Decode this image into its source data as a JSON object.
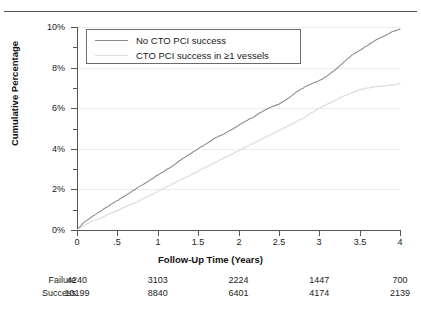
{
  "chart_data": {
    "type": "line",
    "title": "",
    "xlabel": "Follow-Up Time (Years)",
    "ylabel": "Cumulative Percentage",
    "xlim": [
      0,
      4
    ],
    "ylim": [
      0,
      10
    ],
    "grid": true,
    "legend_position": "top-left",
    "xticks": [
      "0",
      ".5",
      "1",
      "1.5",
      "2",
      "2.5",
      "3",
      "3.5",
      "4"
    ],
    "xtick_values": [
      0,
      0.5,
      1,
      1.5,
      2,
      2.5,
      3,
      3.5,
      4
    ],
    "yticks": [
      "0%",
      "2%",
      "4%",
      "6%",
      "8%",
      "10%"
    ],
    "ytick_values": [
      0,
      2,
      4,
      6,
      8,
      10
    ],
    "yminor_values": [
      1,
      3,
      5,
      7,
      9
    ],
    "series": [
      {
        "name": "No CTO PCI success",
        "color": "#8c8c8c",
        "x": [
          0,
          0.08,
          0.15,
          0.22,
          0.3,
          0.4,
          0.5,
          0.6,
          0.7,
          0.8,
          0.9,
          1.0,
          1.1,
          1.2,
          1.3,
          1.4,
          1.5,
          1.6,
          1.7,
          1.8,
          1.9,
          2.0,
          2.1,
          2.2,
          2.3,
          2.4,
          2.5,
          2.6,
          2.7,
          2.8,
          2.9,
          3.0,
          3.1,
          3.2,
          3.3,
          3.4,
          3.5,
          3.6,
          3.7,
          3.8,
          3.9,
          4.0
        ],
        "y": [
          0,
          0.35,
          0.55,
          0.75,
          0.95,
          1.2,
          1.45,
          1.7,
          1.95,
          2.2,
          2.45,
          2.7,
          2.95,
          3.2,
          3.5,
          3.75,
          4.0,
          4.25,
          4.5,
          4.7,
          4.9,
          5.15,
          5.4,
          5.6,
          5.85,
          6.05,
          6.2,
          6.45,
          6.75,
          7.0,
          7.2,
          7.35,
          7.6,
          7.9,
          8.25,
          8.6,
          8.85,
          9.1,
          9.35,
          9.55,
          9.75,
          9.9
        ]
      },
      {
        "name": "CTO PCI success in ≥1 vessels",
        "color": "#dcdcdc",
        "x": [
          0,
          0.1,
          0.2,
          0.3,
          0.4,
          0.5,
          0.6,
          0.7,
          0.8,
          0.9,
          1.0,
          1.1,
          1.2,
          1.3,
          1.4,
          1.5,
          1.6,
          1.7,
          1.8,
          1.9,
          2.0,
          2.1,
          2.2,
          2.3,
          2.4,
          2.5,
          2.6,
          2.7,
          2.8,
          2.9,
          3.0,
          3.1,
          3.2,
          3.3,
          3.4,
          3.5,
          3.6,
          3.7,
          3.8,
          3.9,
          4.0
        ],
        "y": [
          0,
          0.25,
          0.45,
          0.6,
          0.8,
          0.95,
          1.15,
          1.3,
          1.5,
          1.7,
          1.9,
          2.1,
          2.3,
          2.5,
          2.7,
          2.9,
          3.1,
          3.3,
          3.5,
          3.7,
          3.9,
          4.1,
          4.3,
          4.5,
          4.7,
          4.9,
          5.1,
          5.3,
          5.5,
          5.75,
          6.0,
          6.2,
          6.4,
          6.6,
          6.75,
          6.9,
          7.0,
          7.05,
          7.1,
          7.15,
          7.2
        ]
      }
    ]
  },
  "legend": {
    "items": [
      {
        "label": "No CTO PCI success"
      },
      {
        "label": "CTO PCI success in ≥1 vessels"
      }
    ]
  },
  "risk_table": {
    "rows": [
      {
        "label": "Failure",
        "values": [
          "4240",
          "3103",
          "2224",
          "1447",
          "700"
        ]
      },
      {
        "label": "Success",
        "values": [
          "10199",
          "8840",
          "6401",
          "4174",
          "2139"
        ]
      }
    ],
    "value_x_positions": [
      0,
      1,
      2,
      3,
      4
    ]
  }
}
